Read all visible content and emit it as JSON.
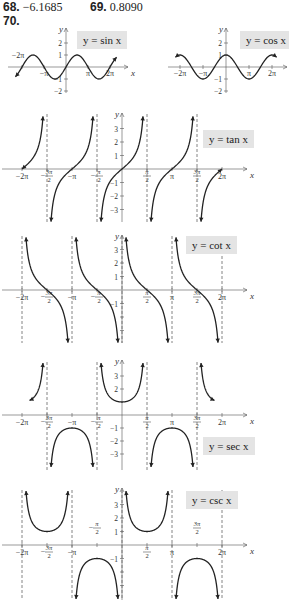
{
  "answers": [
    {
      "num": "68.",
      "value": "−6.1685"
    },
    {
      "num": "69.",
      "value": "0.8090"
    },
    {
      "num": "70.",
      "value": ""
    }
  ],
  "graphs": {
    "sin": {
      "label": "y = sin x",
      "ylabels": [
        "2",
        "1",
        "−1",
        "−2"
      ],
      "xlabels": [
        "−2π",
        "−π",
        "π",
        "2π",
        "x",
        "y"
      ]
    },
    "cos": {
      "label": "y = cos x",
      "ylabels": [
        "2",
        "1",
        "−1",
        "−2"
      ],
      "xlabels": [
        "−2π",
        "−π",
        "π",
        "2π",
        "x",
        "y"
      ]
    },
    "tan": {
      "label": "y = tan x"
    },
    "cot": {
      "label": "y = cot x"
    },
    "sec": {
      "label": "y = sec x"
    },
    "csc": {
      "label": "y = csc x"
    }
  },
  "colors": {
    "curve": "#222222",
    "axis": "#555555",
    "label_bg": "#e4e4e4"
  },
  "chart_data": [
    {
      "type": "line",
      "title": "y = sin x",
      "x": [
        -6.283,
        -4.712,
        -3.1416,
        -1.571,
        0,
        1.571,
        3.1416,
        4.712,
        6.283
      ],
      "values": [
        0,
        1,
        0,
        -1,
        0,
        1,
        0,
        -1,
        0
      ],
      "xlabel": "x",
      "ylabel": "y",
      "xticks": [
        "−2π",
        "−π",
        "π",
        "2π"
      ],
      "yticks": [
        "2",
        "1",
        "−1",
        "−2"
      ],
      "ylim": [
        -2,
        2
      ]
    },
    {
      "type": "line",
      "title": "y = cos x",
      "x": [
        -6.283,
        -4.712,
        -3.1416,
        -1.571,
        0,
        1.571,
        3.1416,
        4.712,
        6.283
      ],
      "values": [
        1,
        0,
        -1,
        0,
        1,
        0,
        -1,
        0,
        1
      ],
      "xlabel": "x",
      "ylabel": "y",
      "xticks": [
        "−2π",
        "−π",
        "π",
        "2π"
      ],
      "yticks": [
        "2",
        "1",
        "−1",
        "−2"
      ],
      "ylim": [
        -2,
        2
      ]
    },
    {
      "type": "line",
      "title": "y = tan x",
      "asymptotes": [
        "−3π/2",
        "−π/2",
        "π/2",
        "3π/2"
      ],
      "xticks": [
        "−2π",
        "−3π/2",
        "−π",
        "−π/2",
        "π/2",
        "π",
        "3π/2",
        "2π"
      ],
      "yticks": [
        "3",
        "2",
        "1",
        "−1",
        "−2",
        "−3"
      ],
      "zeros": [
        "−2π",
        "−π",
        "0",
        "π",
        "2π"
      ],
      "xlabel": "x",
      "ylabel": "y"
    },
    {
      "type": "line",
      "title": "y = cot x",
      "asymptotes": [
        "−2π",
        "−π",
        "0",
        "π",
        "2π"
      ],
      "xticks": [
        "−2π",
        "−3π/2",
        "−π",
        "−π/2",
        "π/2",
        "π",
        "3π/2",
        "2π"
      ],
      "yticks": [
        "3",
        "2",
        "1",
        "−1"
      ],
      "zeros": [
        "−3π/2",
        "−π/2",
        "π/2",
        "3π/2"
      ],
      "xlabel": "x",
      "ylabel": "y"
    },
    {
      "type": "line",
      "title": "y = sec x",
      "asymptotes": [
        "−3π/2",
        "−π/2",
        "π/2",
        "3π/2"
      ],
      "xticks": [
        "−2π",
        "−3π/2",
        "−π",
        "−π/2",
        "π/2",
        "π",
        "3π/2",
        "2π"
      ],
      "yticks": [
        "3",
        "2",
        "−1",
        "−2",
        "−3"
      ],
      "local_min": [
        {
          "x": "0",
          "y": 1
        }
      ],
      "local_max": [
        {
          "x": "−π",
          "y": -1
        },
        {
          "x": "π",
          "y": -1
        }
      ],
      "xlabel": "x",
      "ylabel": "y"
    },
    {
      "type": "line",
      "title": "y = csc x",
      "asymptotes": [
        "−2π",
        "−π",
        "0",
        "π",
        "2π"
      ],
      "xticks": [
        "−2π",
        "−3π/2",
        "−π",
        "−π/2",
        "π/2",
        "π",
        "3π/2",
        "2π"
      ],
      "yticks": [
        "3",
        "2",
        "1",
        "−1"
      ],
      "local_min": [
        {
          "x": "−3π/2",
          "y": 1
        },
        {
          "x": "π/2",
          "y": 1
        }
      ],
      "local_max": [
        {
          "x": "−π/2",
          "y": -1
        },
        {
          "x": "3π/2",
          "y": -1
        }
      ],
      "xlabel": "x",
      "ylabel": "y"
    }
  ]
}
